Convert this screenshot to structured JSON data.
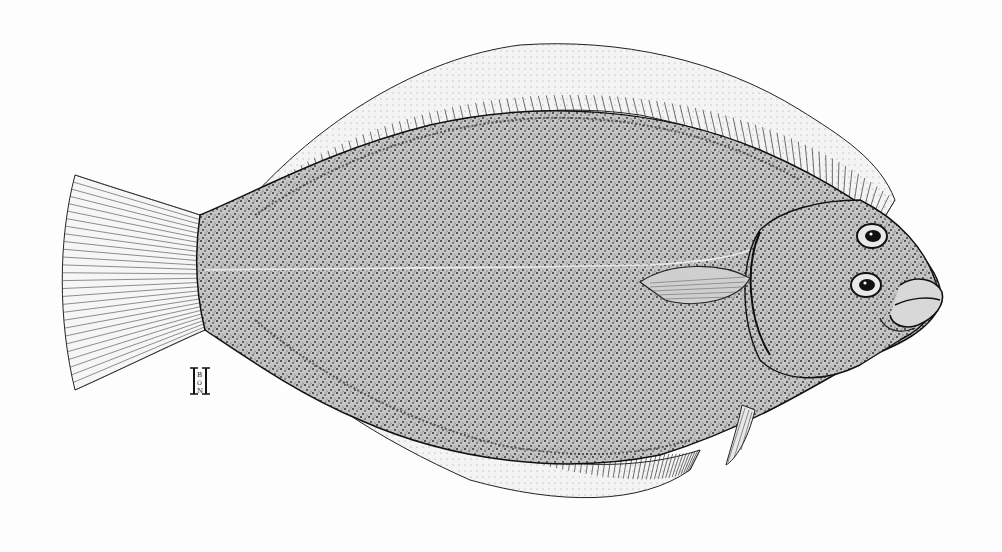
{
  "illustration": {
    "subject": "Flounder (flatfish), lateral view, eyed side",
    "style": "black-and-white stippled scientific pen-and-ink drawing",
    "background_color": "#fdfdfd",
    "ink_color": "#1a1a1a",
    "body_fill_color": "#bdbdbd",
    "fin_fill_color": "#f2f2f2"
  },
  "parts": [
    {
      "name": "body",
      "description": "oval stippled body"
    },
    {
      "name": "dorsal-fin",
      "description": "long fringed fin along upper edge"
    },
    {
      "name": "anal-fin",
      "description": "long fringed fin along lower edge"
    },
    {
      "name": "caudal-fin",
      "description": "fan-shaped tail fin with segmented rays"
    },
    {
      "name": "pectoral-fin",
      "description": "small striated fin behind gill cover"
    },
    {
      "name": "pelvic-fin",
      "description": "small rayed fin below head"
    },
    {
      "name": "eyes",
      "description": "two eyes on right side of head"
    },
    {
      "name": "mouth",
      "description": "thick-lipped mouth at snout"
    },
    {
      "name": "lateral-line",
      "description": "faint line along body midline"
    }
  ],
  "signature": {
    "description": "artist monogram",
    "letters": [
      "H",
      "B",
      "O",
      "N"
    ]
  }
}
